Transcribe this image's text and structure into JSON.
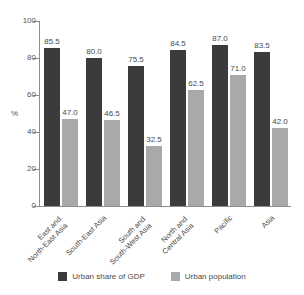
{
  "chart_data": {
    "type": "bar",
    "title": "",
    "xlabel": "",
    "ylabel": "%",
    "ylim": [
      0,
      100
    ],
    "yticks": [
      0,
      20,
      40,
      60,
      80,
      100
    ],
    "ytick_labels": [
      "0",
      "20",
      "40",
      "60",
      "80",
      "100"
    ],
    "grid": false,
    "legend_position": "bottom",
    "categories": [
      "East and\nNorth-East Asia",
      "South-East Asia",
      "South and\nSouth-West Asia",
      "North and\nCentral Asia",
      "Pacific",
      "Asia"
    ],
    "category_lines": [
      [
        "East and",
        "North-East Asia"
      ],
      [
        "South-East Asia",
        ""
      ],
      [
        "South and",
        "South-West Asia"
      ],
      [
        "North and",
        "Central Asia"
      ],
      [
        "Pacific",
        ""
      ],
      [
        "Asia",
        ""
      ]
    ],
    "series": [
      {
        "name": "Urban share of GDP",
        "color": "#3b3b3b",
        "values": [
          85.5,
          80.0,
          75.5,
          84.5,
          87.0,
          83.5
        ],
        "value_labels": [
          "85.5",
          "80.0",
          "75.5",
          "84.5",
          "87.0",
          "83.5"
        ]
      },
      {
        "name": "Urban population",
        "color": "#a9a9a9",
        "values": [
          47.0,
          46.5,
          32.5,
          62.5,
          71.0,
          42.0
        ],
        "value_labels": [
          "47.0",
          "46.5",
          "32.5",
          "62.5",
          "71.0",
          "42.0"
        ]
      }
    ]
  },
  "legend": {
    "items": [
      {
        "label": "Urban share of GDP",
        "color": "#3b3b3b"
      },
      {
        "label": "Urban population",
        "color": "#a9a9a9"
      }
    ]
  },
  "axis": {
    "y_label": "%",
    "y_ticks": [
      "100",
      "80",
      "60",
      "40",
      "20",
      "0"
    ]
  },
  "clipped_top_text": ""
}
